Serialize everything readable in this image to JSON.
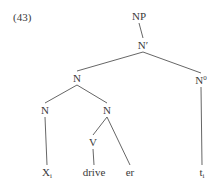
{
  "example_number": "(43)",
  "tree": {
    "nodes": [
      {
        "id": "np",
        "label": "NP",
        "sup": "",
        "sub": ""
      },
      {
        "id": "nbar",
        "label": "N",
        "sup": "′",
        "sub": ""
      },
      {
        "id": "n1",
        "label": "N",
        "sup": "",
        "sub": ""
      },
      {
        "id": "n0",
        "label": "N",
        "sup": "0",
        "sub": ""
      },
      {
        "id": "n2",
        "label": "N",
        "sup": "",
        "sub": ""
      },
      {
        "id": "n3",
        "label": "N",
        "sup": "",
        "sub": ""
      },
      {
        "id": "v",
        "label": "V",
        "sup": "",
        "sub": ""
      },
      {
        "id": "xi",
        "label": "X",
        "sup": "",
        "sub": "i"
      },
      {
        "id": "drive",
        "label": "drive",
        "sup": "",
        "sub": ""
      },
      {
        "id": "er",
        "label": "er",
        "sup": "",
        "sub": ""
      },
      {
        "id": "ti",
        "label": "t",
        "sup": "",
        "sub": "i"
      }
    ],
    "edges": [
      [
        "np",
        "nbar"
      ],
      [
        "nbar",
        "n1"
      ],
      [
        "nbar",
        "n0"
      ],
      [
        "n1",
        "n2"
      ],
      [
        "n1",
        "n3"
      ],
      [
        "n0",
        "ti"
      ],
      [
        "n2",
        "xi"
      ],
      [
        "n3",
        "v"
      ],
      [
        "n3",
        "er"
      ],
      [
        "v",
        "drive"
      ]
    ]
  }
}
